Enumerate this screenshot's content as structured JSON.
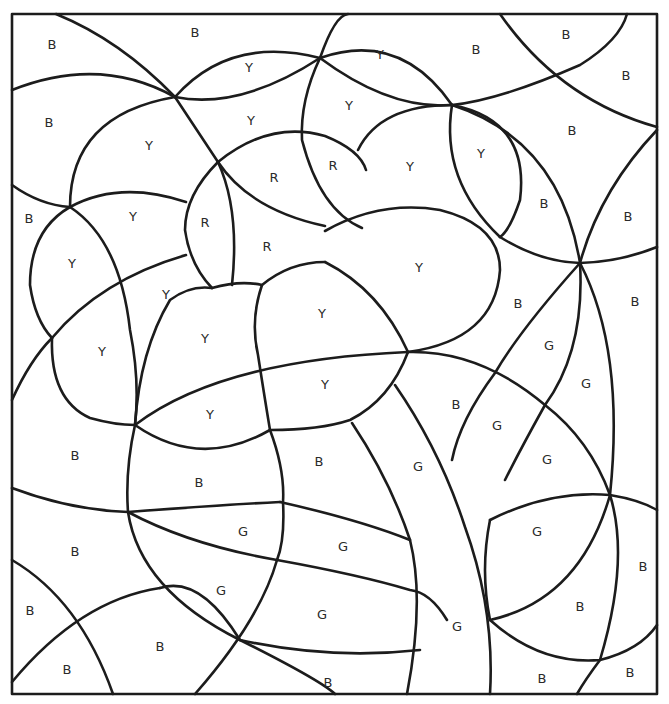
{
  "page": {
    "type": "color-by-letter coloring sheet",
    "legend_letters": [
      "B",
      "Y",
      "R",
      "G"
    ]
  },
  "regions": [
    {
      "letter": "B",
      "x": 52,
      "y": 44
    },
    {
      "letter": "B",
      "x": 195,
      "y": 32
    },
    {
      "letter": "Y",
      "x": 249,
      "y": 67
    },
    {
      "letter": "Y",
      "x": 380,
      "y": 54
    },
    {
      "letter": "B",
      "x": 476,
      "y": 49
    },
    {
      "letter": "B",
      "x": 566,
      "y": 34
    },
    {
      "letter": "B",
      "x": 626,
      "y": 75
    },
    {
      "letter": "B",
      "x": 49,
      "y": 122
    },
    {
      "letter": "Y",
      "x": 149,
      "y": 145
    },
    {
      "letter": "Y",
      "x": 251,
      "y": 120
    },
    {
      "letter": "Y",
      "x": 349,
      "y": 105
    },
    {
      "letter": "B",
      "x": 572,
      "y": 130
    },
    {
      "letter": "R",
      "x": 274,
      "y": 177
    },
    {
      "letter": "R",
      "x": 333,
      "y": 165
    },
    {
      "letter": "Y",
      "x": 410,
      "y": 166
    },
    {
      "letter": "Y",
      "x": 481,
      "y": 153
    },
    {
      "letter": "B",
      "x": 544,
      "y": 203
    },
    {
      "letter": "B",
      "x": 628,
      "y": 216
    },
    {
      "letter": "B",
      "x": 29,
      "y": 218
    },
    {
      "letter": "Y",
      "x": 133,
      "y": 216
    },
    {
      "letter": "R",
      "x": 205,
      "y": 222
    },
    {
      "letter": "R",
      "x": 267,
      "y": 246
    },
    {
      "letter": "Y",
      "x": 72,
      "y": 263
    },
    {
      "letter": "Y",
      "x": 166,
      "y": 294
    },
    {
      "letter": "Y",
      "x": 419,
      "y": 267
    },
    {
      "letter": "B",
      "x": 518,
      "y": 303
    },
    {
      "letter": "B",
      "x": 635,
      "y": 301
    },
    {
      "letter": "Y",
      "x": 102,
      "y": 351
    },
    {
      "letter": "Y",
      "x": 205,
      "y": 338
    },
    {
      "letter": "Y",
      "x": 322,
      "y": 313
    },
    {
      "letter": "G",
      "x": 549,
      "y": 345
    },
    {
      "letter": "G",
      "x": 586,
      "y": 383
    },
    {
      "letter": "Y",
      "x": 325,
      "y": 384
    },
    {
      "letter": "Y",
      "x": 210,
      "y": 414
    },
    {
      "letter": "B",
      "x": 456,
      "y": 404
    },
    {
      "letter": "G",
      "x": 497,
      "y": 425
    },
    {
      "letter": "B",
      "x": 75,
      "y": 455
    },
    {
      "letter": "B",
      "x": 319,
      "y": 461
    },
    {
      "letter": "G",
      "x": 418,
      "y": 466
    },
    {
      "letter": "G",
      "x": 547,
      "y": 459
    },
    {
      "letter": "B",
      "x": 199,
      "y": 482
    },
    {
      "letter": "G",
      "x": 243,
      "y": 531
    },
    {
      "letter": "G",
      "x": 343,
      "y": 546
    },
    {
      "letter": "G",
      "x": 537,
      "y": 531
    },
    {
      "letter": "B",
      "x": 75,
      "y": 551
    },
    {
      "letter": "B",
      "x": 643,
      "y": 566
    },
    {
      "letter": "G",
      "x": 221,
      "y": 590
    },
    {
      "letter": "G",
      "x": 322,
      "y": 614
    },
    {
      "letter": "B",
      "x": 580,
      "y": 606
    },
    {
      "letter": "B",
      "x": 30,
      "y": 610
    },
    {
      "letter": "G",
      "x": 457,
      "y": 626
    },
    {
      "letter": "B",
      "x": 160,
      "y": 646
    },
    {
      "letter": "B",
      "x": 67,
      "y": 669
    },
    {
      "letter": "B",
      "x": 328,
      "y": 682
    },
    {
      "letter": "B",
      "x": 542,
      "y": 678
    },
    {
      "letter": "B",
      "x": 630,
      "y": 672
    }
  ]
}
